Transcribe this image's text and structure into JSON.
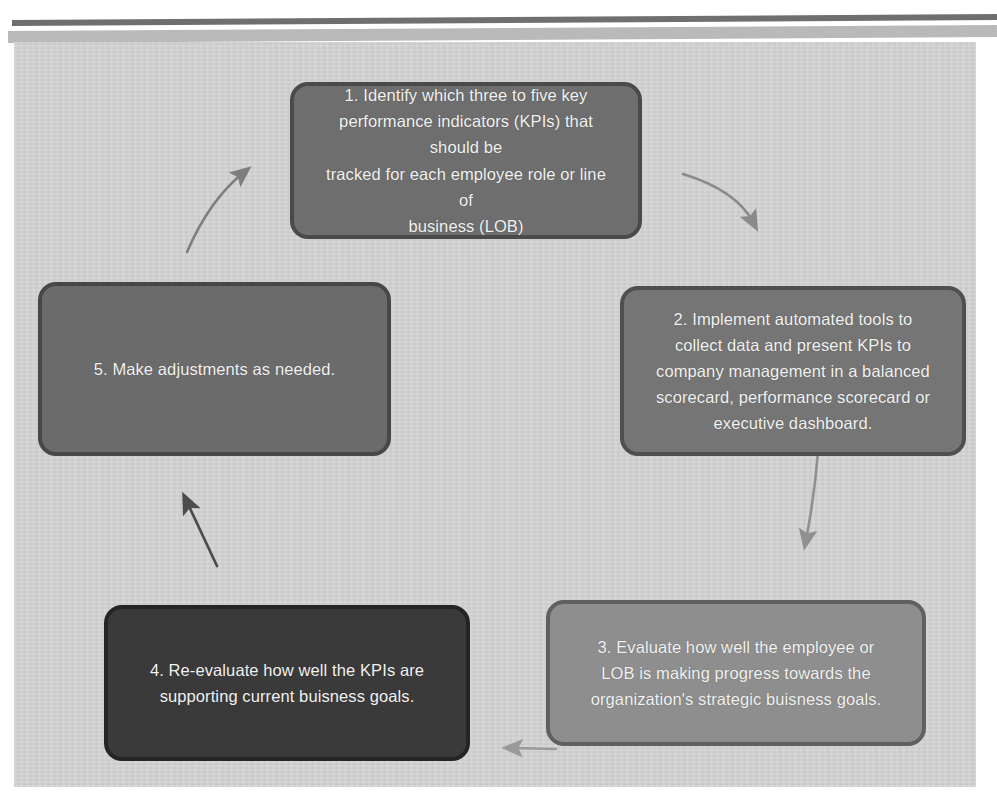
{
  "diagram": {
    "type": "cyclical-process",
    "background_color": "#d3d3d3",
    "page_color": "#ffffff",
    "rule_color": "#6f6f6f",
    "band_color": "#b9b9b9",
    "text_color": "#f2f2f2",
    "step_count": 5,
    "nodes": [
      {
        "id": "step-1",
        "number": "1",
        "text": "1. Identify which three to five key\nperformance indicators (KPIs) that should be\ntracked for each employee role or line of\nbusiness (LOB)",
        "fill": "#6e6e6e",
        "border": "#4a4a4a"
      },
      {
        "id": "step-2",
        "number": "2",
        "text": "2. Implement automated tools to\ncollect data and present KPIs to\ncompany management in a balanced\nscorecard, performance scorecard or\nexecutive dashboard.",
        "fill": "#757575",
        "border": "#4f4f4f"
      },
      {
        "id": "step-3",
        "number": "3",
        "text": "3. Evaluate how well the employee or\nLOB is making progress towards the\norganization's strategic buisness goals.",
        "fill": "#8e8e8e",
        "border": "#606060"
      },
      {
        "id": "step-4",
        "number": "4",
        "text": "4. Re-evaluate how well the KPIs are\nsupporting current buisness goals.",
        "fill": "#3a3a3a",
        "border": "#242424"
      },
      {
        "id": "step-5",
        "number": "5",
        "text": "5. Make adjustments as needed.",
        "fill": "#6b6b6b",
        "border": "#474747"
      }
    ],
    "connectors": [
      {
        "id": "arrow-1-to-2",
        "from": "step-1",
        "to": "step-2",
        "style": "curved",
        "color": "#8a8a8a",
        "direction": "down-right"
      },
      {
        "id": "arrow-2-to-3",
        "from": "step-2",
        "to": "step-3",
        "style": "curved",
        "color": "#909090",
        "direction": "down"
      },
      {
        "id": "arrow-3-to-4",
        "from": "step-3",
        "to": "step-4",
        "style": "straight",
        "color": "#9a9a9a",
        "direction": "left"
      },
      {
        "id": "arrow-4-to-5",
        "from": "step-4",
        "to": "step-5",
        "style": "straight",
        "color": "#4c4c4c",
        "direction": "up-left"
      },
      {
        "id": "arrow-5-to-1",
        "from": "step-5",
        "to": "step-1",
        "style": "curved",
        "color": "#7e7e7e",
        "direction": "up-right"
      }
    ]
  }
}
